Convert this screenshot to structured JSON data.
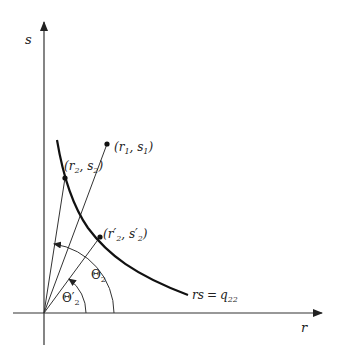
{
  "diagram": {
    "type": "geometric-plot",
    "axes": {
      "x_label": "r",
      "y_label": "s"
    },
    "curve": {
      "label_lhs": "rs",
      "label_eq": "=",
      "label_rhs": "q",
      "label_rhs_sub": "22"
    },
    "points": [
      {
        "id": "p1",
        "label_open": "(r",
        "sub1": "1",
        "comma": ", s",
        "sub2": "1",
        "label_close": ")"
      },
      {
        "id": "p2",
        "label_open": "(r",
        "sub1": "2",
        "comma": ", s",
        "sub2": "2",
        "label_close": ")"
      },
      {
        "id": "p2prime",
        "label_open": "(r′",
        "sub1": "2",
        "comma": ", s′",
        "sub2": "2",
        "label_close": ")"
      }
    ],
    "angles": [
      {
        "id": "theta2",
        "symbol": "Θ",
        "sub": "2"
      },
      {
        "id": "theta2prime",
        "symbol": "Θ′",
        "sub": "2"
      }
    ]
  }
}
